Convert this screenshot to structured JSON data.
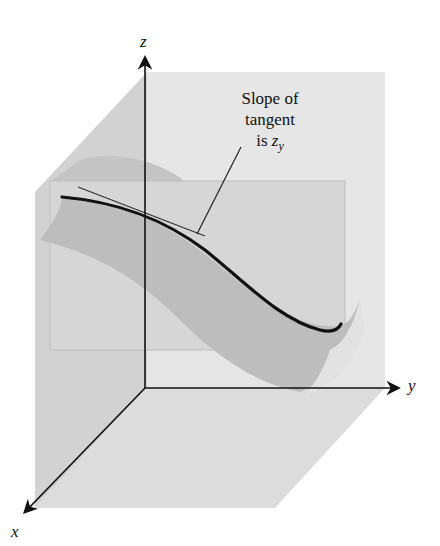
{
  "figure": {
    "type": "3d-coordinate-diagram",
    "axes": {
      "x": {
        "label": "x"
      },
      "y": {
        "label": "y"
      },
      "z": {
        "label": "z"
      }
    },
    "annotation": {
      "line1": "Slope of",
      "line2": "tangent",
      "line3_prefix": "is ",
      "line3_var": "z",
      "line3_sub": "y"
    },
    "colors": {
      "background": "#ffffff",
      "back_wall": "#e4e4e4",
      "left_wall": "#d4d4d4",
      "floor": "#dedede",
      "cutting_plane": "#d0d0d0",
      "surface": "#b8b8b8",
      "surface_light": "#c8c8c8",
      "curve": "#111111",
      "axes": "#111111"
    }
  }
}
